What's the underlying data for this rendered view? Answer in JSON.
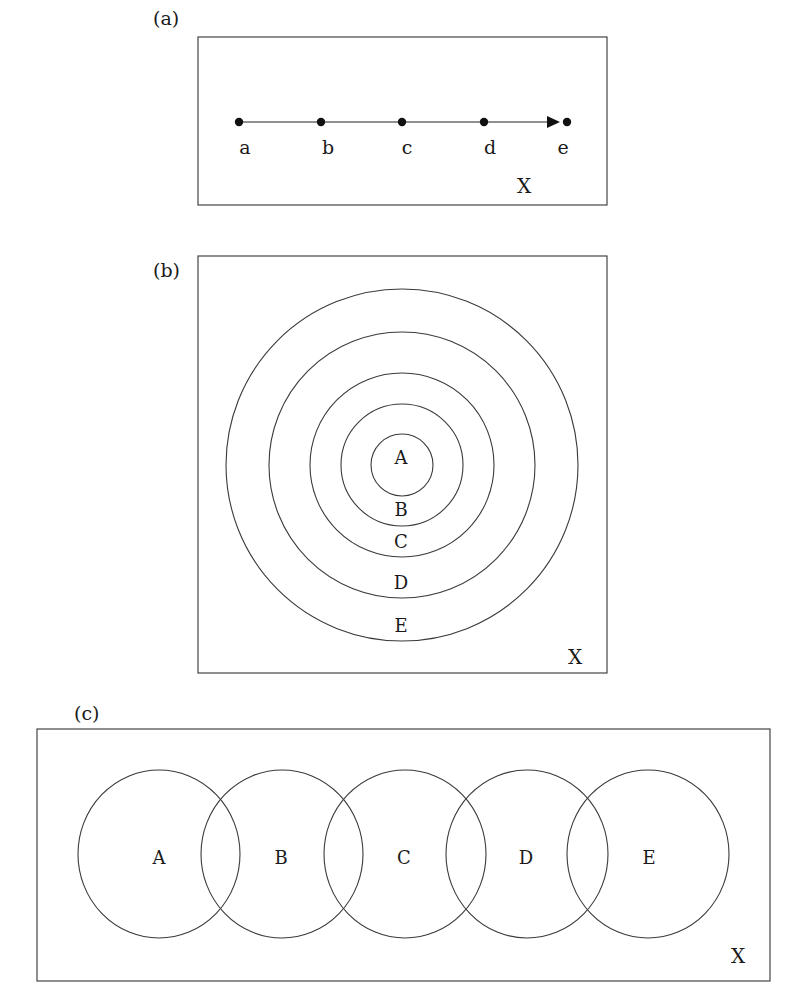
{
  "figure": {
    "panels": [
      {
        "id": "a",
        "tag": "(a)",
        "description": "Ordered chain of points on a line inside universe X",
        "points": [
          {
            "label": "a",
            "x": 239
          },
          {
            "label": "b",
            "x": 321
          },
          {
            "label": "c",
            "x": 402
          },
          {
            "label": "d",
            "x": 484
          },
          {
            "label": "e",
            "x": 567
          }
        ],
        "universe_label": "X"
      },
      {
        "id": "b",
        "tag": "(b)",
        "description": "Nested concentric sets A inside B inside C inside D inside E within X",
        "sets": [
          {
            "label": "A",
            "r": 31
          },
          {
            "label": "B",
            "r": 61
          },
          {
            "label": "C",
            "r": 92
          },
          {
            "label": "D",
            "r": 133
          },
          {
            "label": "E",
            "r": 176
          }
        ],
        "universe_label": "X"
      },
      {
        "id": "c",
        "tag": "(c)",
        "description": "Chain of overlapping sets where each overlaps only its neighbors, within X",
        "sets": [
          {
            "label": "A",
            "cx": 159
          },
          {
            "label": "B",
            "cx": 282
          },
          {
            "label": "C",
            "cx": 405
          },
          {
            "label": "D",
            "cx": 527
          },
          {
            "label": "E",
            "cx": 648
          }
        ],
        "universe_label": "X"
      }
    ]
  },
  "colors": {
    "stroke": "#333333",
    "text": "#1a1a1a",
    "background": "#ffffff"
  }
}
